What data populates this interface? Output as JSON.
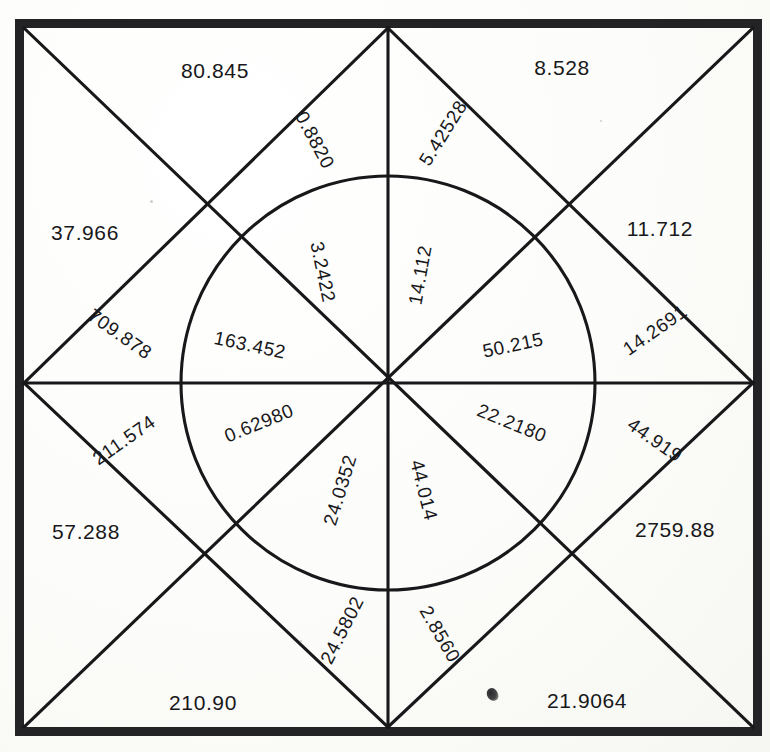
{
  "figure": {
    "type": "geometric-diagram",
    "background_color": "#fbfbf9",
    "ink_color": "#18181a",
    "border_color": "#232325",
    "canvas": {
      "width": 770,
      "height": 752
    },
    "frame": {
      "left": 24,
      "top": 28,
      "right": 753,
      "bottom": 727,
      "thickness": 9
    },
    "center": {
      "x": 388,
      "y": 383
    },
    "circle": {
      "cx": 388,
      "cy": 383,
      "r": 207
    },
    "star_vertices": [
      {
        "name": "top-left-corner",
        "x": 24,
        "y": 28
      },
      {
        "name": "top-midpoint",
        "x": 388,
        "y": 28
      },
      {
        "name": "top-right-corner",
        "x": 753,
        "y": 28
      },
      {
        "name": "right-midpoint",
        "x": 753,
        "y": 383
      },
      {
        "name": "bottom-right-corner",
        "x": 753,
        "y": 727
      },
      {
        "name": "bottom-midpoint",
        "x": 388,
        "y": 727
      },
      {
        "name": "bottom-left-corner",
        "x": 24,
        "y": 727
      },
      {
        "name": "left-midpoint",
        "x": 24,
        "y": 383
      }
    ],
    "inner_square_vertices": [
      {
        "name": "upper-left-node",
        "x": 238,
        "y": 240
      },
      {
        "name": "upper-right-node",
        "x": 538,
        "y": 240
      },
      {
        "name": "lower-right-node",
        "x": 538,
        "y": 527
      },
      {
        "name": "lower-left-node",
        "x": 238,
        "y": 527
      }
    ]
  },
  "labels": {
    "outer": [
      {
        "id": "outer-top-left",
        "value": "80.845",
        "x": 215,
        "y": 70,
        "rotation": 0
      },
      {
        "id": "outer-top-right",
        "value": "8.528",
        "x": 562,
        "y": 67,
        "rotation": 0
      },
      {
        "id": "outer-left-upper",
        "value": "37.966",
        "x": 85,
        "y": 232,
        "rotation": 0
      },
      {
        "id": "outer-right-upper",
        "value": "11.712",
        "x": 660,
        "y": 228,
        "rotation": 0
      },
      {
        "id": "outer-left-lower",
        "value": "57.288",
        "x": 86,
        "y": 531,
        "rotation": 0
      },
      {
        "id": "outer-right-lower",
        "value": "2759.88",
        "x": 675,
        "y": 529,
        "rotation": 0
      },
      {
        "id": "outer-bottom-left",
        "value": "210.90",
        "x": 203,
        "y": 702,
        "rotation": 0
      },
      {
        "id": "outer-bottom-right",
        "value": "21.9064",
        "x": 587,
        "y": 700,
        "rotation": 0
      }
    ],
    "mid": [
      {
        "id": "mid-top-left",
        "value": "0.8820",
        "x": 315,
        "y": 140,
        "rotation": 62
      },
      {
        "id": "mid-top-right",
        "value": "5.42528",
        "x": 443,
        "y": 133,
        "rotation": -58
      },
      {
        "id": "mid-left-upper",
        "value": "709.878",
        "x": 120,
        "y": 334,
        "rotation": 35
      },
      {
        "id": "mid-right-upper",
        "value": "14.2691",
        "x": 655,
        "y": 330,
        "rotation": -35
      },
      {
        "id": "mid-left-lower",
        "value": "211.574",
        "x": 124,
        "y": 440,
        "rotation": -35
      },
      {
        "id": "mid-right-lower",
        "value": "44.919",
        "x": 655,
        "y": 440,
        "rotation": 35
      },
      {
        "id": "mid-bottom-left",
        "value": "24.5802",
        "x": 342,
        "y": 630,
        "rotation": -63
      },
      {
        "id": "mid-bottom-right",
        "value": "2.8560",
        "x": 440,
        "y": 634,
        "rotation": 60
      }
    ],
    "inner": [
      {
        "id": "inner-upper-left-diag",
        "value": "3.2422",
        "x": 323,
        "y": 272,
        "rotation": 78
      },
      {
        "id": "inner-upper-right-vert",
        "value": "14.112",
        "x": 420,
        "y": 275,
        "rotation": -80
      },
      {
        "id": "inner-left-upper-horiz",
        "value": "163.452",
        "x": 250,
        "y": 345,
        "rotation": 12
      },
      {
        "id": "inner-right-upper-horiz",
        "value": "50.215",
        "x": 513,
        "y": 345,
        "rotation": -12
      },
      {
        "id": "inner-left-lower-horiz",
        "value": "0.62980",
        "x": 259,
        "y": 423,
        "rotation": -22
      },
      {
        "id": "inner-right-lower-horiz",
        "value": "22.2180",
        "x": 512,
        "y": 423,
        "rotation": 22
      },
      {
        "id": "inner-lower-left-diag",
        "value": "24.0352",
        "x": 340,
        "y": 490,
        "rotation": -73
      },
      {
        "id": "inner-lower-right-vert",
        "value": "44.014",
        "x": 424,
        "y": 490,
        "rotation": 76
      }
    ]
  },
  "artifacts": {
    "ink_smudge": {
      "x": 487,
      "y": 688
    }
  }
}
